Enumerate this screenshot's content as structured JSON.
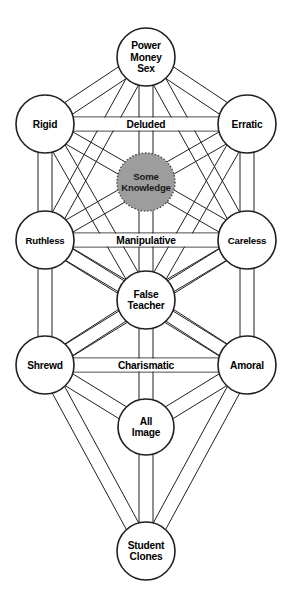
{
  "diagram": {
    "type": "tree-of-life-network",
    "background_color": "#ffffff",
    "line_color": "#231f20",
    "hidden_node_fill": "#9d9d9d",
    "nodes": [
      {
        "id": "crown",
        "label_lines": [
          "Power",
          "Money",
          "Sex"
        ],
        "cx": 146,
        "cy": 57,
        "r": 29,
        "style": "solid"
      },
      {
        "id": "left-upper",
        "label_lines": [
          "Rigid"
        ],
        "cx": 45,
        "cy": 124,
        "r": 29,
        "style": "solid"
      },
      {
        "id": "right-upper",
        "label_lines": [
          "Erratic"
        ],
        "cx": 247,
        "cy": 124,
        "r": 29,
        "style": "solid"
      },
      {
        "id": "hidden",
        "label_lines": [
          "Some",
          "Knowledge"
        ],
        "cx": 146,
        "cy": 182,
        "r": 29,
        "style": "dashed-grey"
      },
      {
        "id": "left-mid",
        "label_lines": [
          "Ruthless"
        ],
        "cx": 45,
        "cy": 240,
        "r": 29,
        "style": "solid"
      },
      {
        "id": "right-mid",
        "label_lines": [
          "Careless"
        ],
        "cx": 247,
        "cy": 240,
        "r": 29,
        "style": "solid"
      },
      {
        "id": "center",
        "label_lines": [
          "False",
          "Teacher"
        ],
        "cx": 146,
        "cy": 300,
        "r": 29,
        "style": "solid"
      },
      {
        "id": "left-lower",
        "label_lines": [
          "Shrewd"
        ],
        "cx": 45,
        "cy": 365,
        "r": 29,
        "style": "solid"
      },
      {
        "id": "right-lower",
        "label_lines": [
          "Amoral"
        ],
        "cx": 247,
        "cy": 365,
        "r": 29,
        "style": "solid"
      },
      {
        "id": "foundation",
        "label_lines": [
          "All",
          "Image"
        ],
        "cx": 146,
        "cy": 427,
        "r": 28,
        "style": "solid"
      },
      {
        "id": "kingdom",
        "label_lines": [
          "Student",
          "Clones"
        ],
        "cx": 146,
        "cy": 551,
        "r": 29,
        "style": "solid"
      }
    ],
    "labelled_paths": [
      {
        "id": "path-deluded",
        "label": "Deluded",
        "from": "left-upper",
        "to": "right-upper",
        "y": 124
      },
      {
        "id": "path-manipulative",
        "label": "Manipulative",
        "from": "left-mid",
        "to": "right-mid",
        "y": 240
      },
      {
        "id": "path-charismatic",
        "label": "Charismatic",
        "from": "left-lower",
        "to": "right-lower",
        "y": 365
      }
    ],
    "edges": [
      [
        "crown",
        "left-upper"
      ],
      [
        "crown",
        "right-upper"
      ],
      [
        "crown",
        "left-mid"
      ],
      [
        "crown",
        "right-mid"
      ],
      [
        "crown",
        "hidden"
      ],
      [
        "hidden",
        "center"
      ],
      [
        "left-upper",
        "right-upper"
      ],
      [
        "left-upper",
        "left-mid"
      ],
      [
        "right-upper",
        "right-mid"
      ],
      [
        "left-upper",
        "center"
      ],
      [
        "right-upper",
        "center"
      ],
      [
        "left-upper",
        "right-mid"
      ],
      [
        "right-upper",
        "left-mid"
      ],
      [
        "left-mid",
        "right-mid"
      ],
      [
        "left-mid",
        "center"
      ],
      [
        "right-mid",
        "center"
      ],
      [
        "left-mid",
        "left-lower"
      ],
      [
        "right-mid",
        "right-lower"
      ],
      [
        "left-mid",
        "right-lower"
      ],
      [
        "right-mid",
        "left-lower"
      ],
      [
        "center",
        "left-lower"
      ],
      [
        "center",
        "right-lower"
      ],
      [
        "center",
        "foundation"
      ],
      [
        "left-lower",
        "right-lower"
      ],
      [
        "left-lower",
        "foundation"
      ],
      [
        "right-lower",
        "foundation"
      ],
      [
        "left-lower",
        "kingdom"
      ],
      [
        "right-lower",
        "kingdom"
      ],
      [
        "foundation",
        "kingdom"
      ]
    ]
  }
}
